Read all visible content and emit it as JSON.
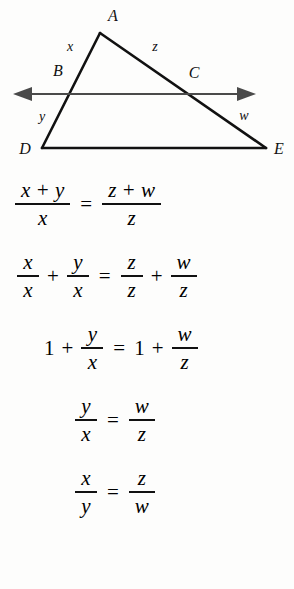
{
  "figure": {
    "name": "triangle-with-parallel-line-diagram",
    "vertices": [
      {
        "id": "A",
        "label": "A",
        "x": 100,
        "y": 33,
        "label_x": 113,
        "label_y": 17
      },
      {
        "id": "B",
        "label": "B",
        "x": 68,
        "y": 94,
        "label_x": 58,
        "label_y": 72
      },
      {
        "id": "C",
        "label": "C",
        "x": 192,
        "y": 94,
        "label_x": 194,
        "label_y": 74
      },
      {
        "id": "D",
        "label": "D",
        "x": 42,
        "y": 148,
        "label_x": 25,
        "label_y": 150
      },
      {
        "id": "E",
        "label": "E",
        "x": 266,
        "y": 148,
        "label_x": 279,
        "label_y": 150
      }
    ],
    "segment_labels": [
      {
        "id": "x",
        "label": "x",
        "x": 70,
        "y": 48,
        "segment": "A-B"
      },
      {
        "id": "z",
        "label": "z",
        "x": 155,
        "y": 48,
        "segment": "A-C"
      },
      {
        "id": "y",
        "label": "y",
        "x": 42,
        "y": 118,
        "segment": "B-D"
      },
      {
        "id": "w",
        "label": "w",
        "x": 244,
        "y": 117,
        "segment": "C-E"
      }
    ],
    "transversal_line": {
      "name": "bidirectional-line-BC",
      "y": 94,
      "x_start": 13,
      "x_end": 256,
      "left_arrow": "arrow-left",
      "right_arrow": "arrow-right"
    },
    "colors": {
      "stroke": "#111111",
      "arrow_stroke": "#4a4a4a",
      "background": "#fdfdfc"
    }
  },
  "equations": [
    {
      "id": "eq1",
      "text": "(x + y)/x = (z + w)/z",
      "left": {
        "num": "x + y",
        "den": "x"
      },
      "right": {
        "num": "z + w",
        "den": "z"
      },
      "relation": "="
    },
    {
      "id": "eq2",
      "text": "x/x + y/x = z/z + w/z",
      "terms": [
        {
          "num": "x",
          "den": "x"
        },
        {
          "num": "y",
          "den": "x"
        },
        {
          "num": "z",
          "den": "z"
        },
        {
          "num": "w",
          "den": "z"
        }
      ],
      "plus": "+",
      "relation": "="
    },
    {
      "id": "eq3",
      "text": "1 + y/x = 1 + w/z",
      "one": "1",
      "plus": "+",
      "relation": "=",
      "left": {
        "num": "y",
        "den": "x"
      },
      "right": {
        "num": "w",
        "den": "z"
      }
    },
    {
      "id": "eq4",
      "text": "y/x = w/z",
      "left": {
        "num": "y",
        "den": "x"
      },
      "right": {
        "num": "w",
        "den": "z"
      },
      "relation": "="
    },
    {
      "id": "eq5",
      "text": "x/y = z/w",
      "left": {
        "num": "x",
        "den": "y"
      },
      "right": {
        "num": "z",
        "den": "w"
      },
      "relation": "="
    }
  ]
}
